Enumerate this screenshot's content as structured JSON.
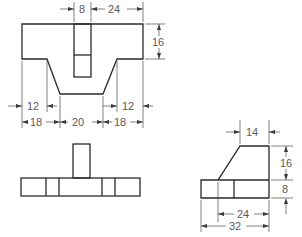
{
  "drawing": {
    "type": "orthographic-projection",
    "views": [
      "front-view",
      "top-view",
      "side-view"
    ],
    "line_color": "#2a2a2a",
    "dimension_color": "#5a5a5a"
  },
  "front_view": {
    "dimensions": {
      "slot_width": "8",
      "right_top_width": "24",
      "top_height": "16",
      "left_inner_offset": "12",
      "right_inner_offset": "12",
      "left_bottom": "18",
      "center_bottom": "20",
      "right_bottom": "18"
    }
  },
  "top_view": {},
  "side_view": {
    "dimensions": {
      "top_width": "14",
      "upper_height": "16",
      "base_height": "8",
      "inner_length": "24",
      "total_length": "32"
    }
  }
}
